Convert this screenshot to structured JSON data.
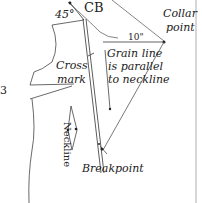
{
  "diagram": {
    "labels": {
      "angle": "45°",
      "center_back": "CB",
      "collar_point": [
        "Collar",
        "point"
      ],
      "measurement": "10\"",
      "grain_note": [
        "Grain line",
        "is parallel",
        "to neckline"
      ],
      "cross_mark": [
        "Cross",
        "mark"
      ],
      "neckline": "Neckline",
      "breakpoint": "Breakpoint",
      "edge_fragment": "3"
    },
    "colors": {
      "line": "#333333",
      "light_line": "#999999",
      "text": "#222222",
      "background": "#ffffff"
    }
  }
}
